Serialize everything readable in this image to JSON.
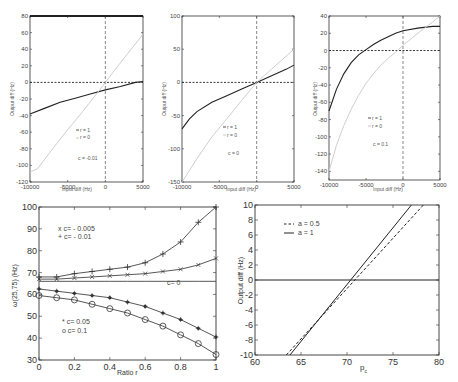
{
  "chart_data": [
    {
      "id": "top-left",
      "type": "line",
      "title": "",
      "xlabel": "Input diff (Hz)",
      "ylabel": "Output diff (Hz)",
      "xlim": [
        -10000,
        5000
      ],
      "ylim": [
        -120,
        80
      ],
      "xticks": [
        -10000,
        -5000,
        0,
        5000
      ],
      "xtick_labels": [
        "-10000",
        "-5000",
        "0",
        "5000"
      ],
      "yticks": [
        -120,
        -100,
        -80,
        -60,
        -40,
        -20,
        0,
        20,
        40,
        60,
        80
      ],
      "yticks_labels": [
        "-120",
        "-100",
        "-80",
        "-60",
        "-40",
        "-20",
        "0",
        "20",
        "40",
        "60",
        "80"
      ],
      "annotation": "c = -0.01",
      "legend": [
        "r = 1",
        "r = 0"
      ],
      "series": [
        {
          "name": "r = 1",
          "color": "#222222",
          "x": [
            -10000,
            -8000,
            -6000,
            -4000,
            -2000,
            0,
            2000,
            4000,
            5000
          ],
          "y": [
            -38,
            -31,
            -24,
            -19,
            -14,
            -9,
            -5,
            0,
            1
          ]
        },
        {
          "name": "r = 0",
          "color": "#c8c8c8",
          "x": [
            -10000,
            -9000,
            -7000,
            -5000,
            -3000,
            -1000,
            0,
            1000,
            3000,
            5000
          ],
          "y": [
            -108,
            -104,
            -80,
            -57,
            -35,
            -12,
            0,
            12,
            35,
            58
          ]
        }
      ],
      "ref_lines": {
        "h": 0,
        "v": 0
      }
    },
    {
      "id": "top-middle",
      "type": "line",
      "title": "",
      "xlabel": "Input diff (Hz)",
      "ylabel": "Output diff (Hz)",
      "xlim": [
        -10000,
        5000
      ],
      "ylim": [
        -150,
        100
      ],
      "xticks": [
        -10000,
        -5000,
        0,
        5000
      ],
      "xtick_labels": [
        "-10000",
        "-5000",
        "0",
        "5000"
      ],
      "yticks": [
        -150,
        -100,
        -50,
        0,
        50,
        100
      ],
      "yticks_labels": [
        "-150",
        "-100",
        "-50",
        "0",
        "50",
        "100"
      ],
      "annotation": "c = 0",
      "legend": [
        "r = 1",
        "r = 0"
      ],
      "series": [
        {
          "name": "r = 1",
          "color": "#222222",
          "x": [
            -10000,
            -9000,
            -8000,
            -6000,
            -4000,
            -2000,
            0,
            2000,
            4000,
            5000
          ],
          "y": [
            -70,
            -55,
            -44,
            -30,
            -20,
            -10,
            0,
            10,
            20,
            26
          ]
        },
        {
          "name": "r = 0",
          "color": "#c8c8c8",
          "x": [
            -10000,
            -8000,
            -6000,
            -4000,
            -2000,
            0,
            2000,
            4000,
            5000
          ],
          "y": [
            -150,
            -115,
            -82,
            -55,
            -27,
            0,
            20,
            40,
            50
          ]
        }
      ],
      "ref_lines": {
        "h": 0,
        "v": 0
      }
    },
    {
      "id": "top-right",
      "type": "line",
      "title": "",
      "xlabel": "Input diff (Hz)",
      "ylabel": "Output diff (Hz)",
      "xlim": [
        -10000,
        5000
      ],
      "ylim": [
        -150,
        40
      ],
      "xticks": [
        -10000,
        -5000,
        0,
        5000
      ],
      "xtick_labels": [
        "-10000",
        "-5000",
        "0",
        "5000"
      ],
      "yticks": [
        -140,
        -120,
        -100,
        -80,
        -60,
        -40,
        -20,
        0,
        20,
        40
      ],
      "yticks_labels": [
        "-140",
        "-120",
        "-100",
        "-80",
        "-60",
        "-40",
        "-20",
        "0",
        "20",
        "40"
      ],
      "annotation": "c = 0.1",
      "legend": [
        "r = 1",
        "r = 0"
      ],
      "series": [
        {
          "name": "r = 1",
          "color": "#222222",
          "x": [
            -10000,
            -9000,
            -8000,
            -7000,
            -6000,
            -5000,
            -4000,
            -3000,
            -2000,
            -1000,
            0,
            2000,
            4000,
            5000
          ],
          "y": [
            -70,
            -45,
            -27,
            -14,
            -5,
            1,
            7,
            12,
            16,
            20,
            23,
            26,
            28,
            28
          ]
        },
        {
          "name": "r = 0",
          "color": "#c8c8c8",
          "x": [
            -10000,
            -9000,
            -8000,
            -7000,
            -6000,
            -5000,
            -4000,
            -3000,
            -2000,
            -1000,
            0,
            2000,
            4000,
            5000
          ],
          "y": [
            -140,
            -110,
            -87,
            -68,
            -52,
            -38,
            -27,
            -17,
            -9,
            -2,
            6,
            20,
            33,
            40
          ]
        }
      ],
      "ref_lines": {
        "h": 0,
        "v": 0
      }
    },
    {
      "id": "bottom-left",
      "type": "line",
      "title": "",
      "xlabel": "Ratio r",
      "ylabel": "ω(25,75) (Hz)",
      "xlim": [
        0,
        1
      ],
      "ylim": [
        30,
        100
      ],
      "xticks": [
        0,
        0.2,
        0.4,
        0.6,
        0.8,
        1
      ],
      "xtick_labels": [
        "0",
        "0.2",
        "0.4",
        "0.6",
        "0.8",
        "1"
      ],
      "yticks": [
        30,
        40,
        50,
        60,
        70,
        80,
        90,
        100
      ],
      "yticks_labels": [
        "30",
        "40",
        "50",
        "60",
        "70",
        "80",
        "90",
        "100"
      ],
      "annotations": [
        "c= 0"
      ],
      "legend_upper": [
        "x c= - 0.005",
        "+ c= - 0.01"
      ],
      "legend_lower": [
        "* c= 0.05",
        "o c= 0.1"
      ],
      "x": [
        0,
        0.1,
        0.2,
        0.3,
        0.4,
        0.5,
        0.6,
        0.7,
        0.8,
        0.9,
        1.0
      ],
      "series": [
        {
          "name": "c= -0.01",
          "marker": "+",
          "values": [
            68,
            68,
            69.5,
            70.5,
            71.5,
            72.5,
            74.5,
            78.5,
            84,
            93,
            100
          ]
        },
        {
          "name": "c= -0.005",
          "marker": "x",
          "values": [
            67,
            67,
            67.5,
            68,
            68.5,
            69,
            69.5,
            70.5,
            71.5,
            73.5,
            76.5
          ]
        },
        {
          "name": "c= 0",
          "marker": "none",
          "values": [
            66,
            66,
            66,
            66,
            66,
            66,
            66,
            66,
            66,
            66,
            66
          ]
        },
        {
          "name": "c= 0.05",
          "marker": "*",
          "values": [
            62.5,
            61.5,
            60.5,
            59.5,
            58.5,
            56.5,
            54.5,
            51.5,
            48.5,
            44.5,
            40.5
          ]
        },
        {
          "name": "c= 0.1",
          "marker": "o",
          "values": [
            59.5,
            58.5,
            57.5,
            55.5,
            53.5,
            51.5,
            48.5,
            45.5,
            41.5,
            37.5,
            32.5
          ]
        }
      ]
    },
    {
      "id": "bottom-right",
      "type": "line",
      "title": "",
      "xlabel": "p_c",
      "ylabel": "Output diff (Hz)",
      "xlim": [
        60,
        80
      ],
      "ylim": [
        -10,
        10
      ],
      "xticks": [
        60,
        65,
        70,
        75,
        80
      ],
      "xtick_labels": [
        "60",
        "65",
        "70",
        "75",
        "80"
      ],
      "yticks": [
        -10,
        -8,
        -6,
        -4,
        -2,
        0,
        2,
        4,
        6,
        8,
        10
      ],
      "yticks_labels": [
        "-10",
        "-8",
        "-6",
        "-4",
        "-2",
        "0",
        "2",
        "4",
        "6",
        "8",
        "10"
      ],
      "legend": [
        "a = 0.5",
        "a = 1"
      ],
      "series": [
        {
          "name": "a = 0.5",
          "style": "dashed",
          "x": [
            63.4,
            78.3
          ],
          "y": [
            -10,
            10
          ]
        },
        {
          "name": "a = 1",
          "style": "solid",
          "x": [
            63.8,
            77.0
          ],
          "y": [
            -10,
            10
          ]
        }
      ],
      "ref_lines": {
        "h": 0
      }
    }
  ],
  "labels": {
    "input_diff": "Input diff (Hz)",
    "output_diff": "Output diff (Hz)",
    "ratio_r": "Ratio r",
    "omega": "ω(25,75) (Hz)",
    "pc_main": "p",
    "pc_sub": "c",
    "r1": "r = 1",
    "r0": "r = 0",
    "c_tl": "c = -0.01",
    "c_tm": "c = 0",
    "c_tr": "c = 0.1",
    "c0": "c= 0",
    "leg_x": "x c= - 0.005",
    "leg_plus": "+ c= - 0.01",
    "leg_star": "* c= 0.05",
    "leg_o": "o c= 0.1",
    "leg_a05": "a = 0.5",
    "leg_a1": "a = 1"
  }
}
